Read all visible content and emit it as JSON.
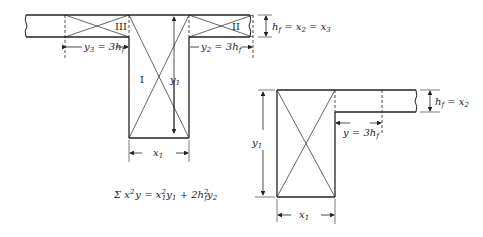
{
  "figure": {
    "left_diagram": {
      "regions": [
        "I",
        "II",
        "III"
      ],
      "labels": {
        "y3": "y",
        "y3_sub": "3",
        "y3_rhs": " = 3h",
        "y3_rhs_sub": "f",
        "y2": "y",
        "y2_sub": "2",
        "y2_rhs": " = 3h",
        "y2_rhs_sub": "f",
        "y1": "y",
        "y1_sub": "1",
        "x1": "x",
        "x1_sub": "1",
        "hf": "h",
        "hf_sub": "f",
        "hf_rhs": " = x",
        "hf_rhs_sub": "2",
        "hf_rhs2": " = x",
        "hf_rhs2_sub": "3"
      }
    },
    "right_diagram": {
      "labels": {
        "y1": "y",
        "y1_sub": "1",
        "x1": "x",
        "x1_sub": "1",
        "y": "y = 3h",
        "y_sub": "f",
        "hf": "h",
        "hf_sub": "f",
        "hf_rhs": " = x",
        "hf_rhs_sub": "2"
      }
    },
    "formula": {
      "sigma": "Σ x",
      "sup1": "2",
      "part2": "y = x",
      "sup2": "2",
      "sub2": "1",
      "part3": "y",
      "sub3": "1",
      "part4": " + 2h",
      "sup4": "2",
      "sub4": "f",
      "part5": "y",
      "sub5": "2"
    }
  }
}
